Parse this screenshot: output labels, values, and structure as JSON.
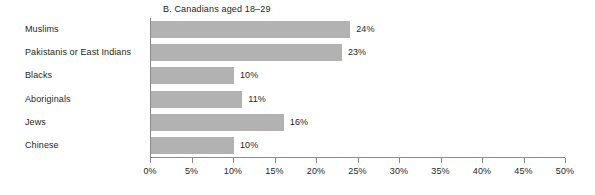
{
  "chart_data": {
    "type": "bar",
    "orientation": "horizontal",
    "title": "B. Canadians aged 18–29",
    "xlabel": "",
    "ylabel": "",
    "categories": [
      "Muslims",
      "Pakistanis or East Indians",
      "Blacks",
      "Aboriginals",
      "Jews",
      "Chinese"
    ],
    "values": [
      24,
      23,
      10,
      11,
      16,
      10
    ],
    "value_labels": [
      "24%",
      "23%",
      "10%",
      "11%",
      "16%",
      "10%"
    ],
    "xlim": [
      0,
      50
    ],
    "xticks": [
      0,
      5,
      10,
      15,
      20,
      25,
      30,
      35,
      40,
      45,
      50
    ],
    "xtick_labels": [
      "0%",
      "5%",
      "10%",
      "15%",
      "20%",
      "25%",
      "30%",
      "35%",
      "40%",
      "45%",
      "50%"
    ],
    "grid": false,
    "legend": null,
    "bar_color": "#b2b2b2",
    "axis_color": "#8a8a8a",
    "text_color": "#1f1f1f",
    "background": "#ffffff"
  }
}
